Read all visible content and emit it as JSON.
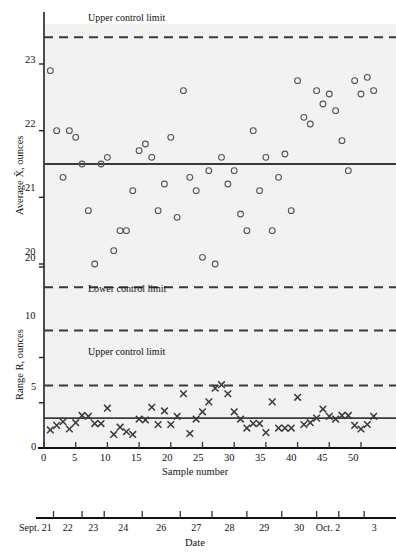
{
  "figure": {
    "background": "#ffffff",
    "plot_background": "#f2f2f2",
    "line_color": "#3a3a3a",
    "marker_color": "#555555"
  },
  "chart_data": [
    {
      "type": "scatter",
      "name": "xbar-chart",
      "title": "",
      "xlabel": "Sample number",
      "ylabel": "Average X̄, ounces",
      "xlim": [
        0,
        53
      ],
      "ylim": [
        19.4,
        23.6
      ],
      "xticks": [
        0,
        5,
        10,
        15,
        20,
        25,
        30,
        35,
        40,
        45,
        50
      ],
      "yticks": [
        20,
        21,
        22,
        23
      ],
      "grid": false,
      "legend": "none",
      "center_line": 21.5,
      "upper_control_limit": 23.4,
      "lower_control_limit": 19.65,
      "annotations": [
        {
          "text": "Upper control limit",
          "x": 8,
          "y": 23.55
        },
        {
          "text": "Lower control limit",
          "x": 8,
          "y": 19.45
        }
      ],
      "x": [
        1,
        2,
        3,
        4,
        5,
        6,
        7,
        8,
        9,
        10,
        11,
        12,
        13,
        14,
        15,
        16,
        17,
        18,
        19,
        20,
        21,
        22,
        23,
        24,
        25,
        26,
        27,
        28,
        29,
        30,
        31,
        32,
        33,
        34,
        35,
        36,
        37,
        38,
        39,
        40,
        41,
        42,
        43,
        44,
        45,
        46,
        47,
        48,
        49,
        50,
        51,
        52
      ],
      "values": [
        22.9,
        22.0,
        21.3,
        22.0,
        21.9,
        21.5,
        20.8,
        20.0,
        21.5,
        21.6,
        20.2,
        20.5,
        20.5,
        21.1,
        21.7,
        21.8,
        21.6,
        20.8,
        21.2,
        21.9,
        20.7,
        22.6,
        21.3,
        21.1,
        20.1,
        21.4,
        20.0,
        21.6,
        21.2,
        21.4,
        20.75,
        20.5,
        22.0,
        21.1,
        21.6,
        20.5,
        21.3,
        21.65,
        20.8,
        22.75,
        22.2,
        22.1,
        22.6,
        22.4,
        22.55,
        22.3,
        21.85,
        21.4,
        22.75,
        22.55,
        22.8,
        22.6
      ]
    },
    {
      "type": "scatter",
      "name": "range-chart",
      "title": "",
      "xlabel": "Sample number",
      "ylabel": "Range R, ounces",
      "xlim": [
        0,
        53
      ],
      "ylim": [
        0,
        21
      ],
      "xticks": [
        0,
        5,
        10,
        15,
        20,
        25,
        30,
        35,
        40,
        45,
        50
      ],
      "yticks": [
        0,
        5,
        10,
        20
      ],
      "grid": false,
      "legend": "none",
      "center_line": 3.3,
      "upper_control_limit": 6.9,
      "lower_control_limit": 13.0,
      "annotations": [
        {
          "text": "Upper control limit",
          "x": 8,
          "y": 7.8
        },
        {
          "text": "Lower control limit",
          "x": 8,
          "y": 11.9
        }
      ],
      "x": [
        1,
        2,
        3,
        4,
        5,
        6,
        7,
        8,
        9,
        10,
        11,
        12,
        13,
        14,
        15,
        16,
        17,
        18,
        19,
        20,
        21,
        22,
        23,
        24,
        25,
        26,
        27,
        28,
        29,
        30,
        31,
        32,
        33,
        34,
        35,
        36,
        37,
        38,
        39,
        40,
        41,
        42,
        43,
        44,
        45,
        46,
        47,
        48,
        49,
        50,
        51,
        52
      ],
      "values": [
        2.0,
        2.5,
        2.9,
        2.1,
        2.8,
        3.6,
        3.5,
        2.7,
        2.7,
        4.4,
        1.5,
        2.3,
        1.8,
        1.5,
        3.2,
        3.1,
        4.5,
        2.6,
        4.1,
        2.6,
        3.5,
        6.0,
        1.6,
        3.2,
        4.0,
        5.1,
        6.6,
        7.0,
        6.0,
        4.0,
        3.2,
        2.2,
        2.7,
        2.7,
        1.7,
        5.1,
        2.2,
        2.2,
        2.2,
        5.6,
        2.6,
        2.8,
        3.3,
        4.3,
        3.5,
        3.2,
        3.6,
        3.6,
        2.5,
        2.1,
        2.6,
        3.5
      ]
    }
  ],
  "date_axis": {
    "label": "Date",
    "ticks": [
      "Sept. 21",
      "22",
      "23",
      "24",
      "26",
      "27",
      "28",
      "29",
      "30",
      "Oct. 2",
      "3"
    ],
    "tick_x": [
      1.5,
      6.0,
      9.5,
      15.5,
      21.5,
      26.5,
      32.0,
      37.5,
      43.0,
      46.5,
      50.5
    ]
  },
  "labels": {
    "xbar_axis_title": "Sample number",
    "xbar_ylabel": "Average X̄, ounces",
    "range_ylabel": "Range R, ounces",
    "date_title": "Date",
    "ucl_top": "Upper control limit",
    "lcl_top": "Lower control limit",
    "ucl_range": "Upper control limit",
    "yt23": "23",
    "yt22": "22",
    "yt21": "21",
    "yt20": "20",
    "rt20": "20",
    "rt10": "10",
    "rt5": "5",
    "rt0": "0",
    "xt0": "0",
    "xt5": "5",
    "xt10": "10",
    "xt15": "15",
    "xt20": "20",
    "xt25": "25",
    "xt30": "30",
    "xt35": "35",
    "xt40": "40",
    "xt45": "45",
    "xt50": "50"
  }
}
